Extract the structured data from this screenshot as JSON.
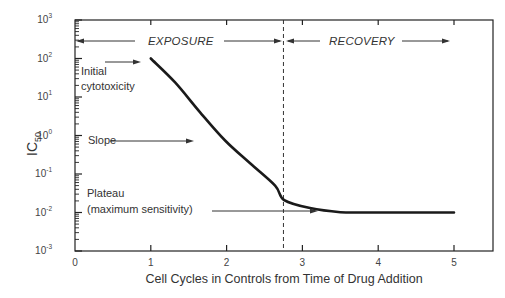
{
  "chart_data": {
    "type": "line",
    "title": "",
    "xlabel": "Cell Cycles in Controls from Time of Drug Addition",
    "ylabel": "IC50",
    "ylabel_main": "IC",
    "ylabel_sub": "50",
    "xlim": [
      0,
      5.5
    ],
    "ylim": [
      0.001,
      1000
    ],
    "yscale": "log",
    "grid": false,
    "legend": null,
    "x_ticks": [
      "0",
      "1",
      "2",
      "3",
      "4",
      "5"
    ],
    "y_ticks": [
      {
        "base": "10",
        "exp": "3"
      },
      {
        "base": "10",
        "exp": "2"
      },
      {
        "base": "10",
        "exp": "1"
      },
      {
        "base": "10",
        "exp": "0"
      },
      {
        "base": "10",
        "exp": "-1"
      },
      {
        "base": "10",
        "exp": "-2"
      },
      {
        "base": "10",
        "exp": "-3"
      }
    ],
    "series": [
      {
        "name": "IC50 curve",
        "x": [
          1.0,
          1.32,
          1.65,
          1.98,
          2.31,
          2.64,
          2.76,
          3.1,
          3.5,
          3.9,
          5.0
        ],
        "y": [
          100,
          24,
          4,
          0.74,
          0.19,
          0.05,
          0.021,
          0.013,
          0.0102,
          0.01,
          0.01
        ]
      }
    ],
    "vertical_marker": {
      "x": 2.75,
      "style": "dashed"
    },
    "phases": [
      {
        "label": "EXPOSURE",
        "x_start": 0,
        "x_end": 2.75
      },
      {
        "label": "RECOVERY",
        "x_start": 2.75,
        "x_end": 5.0
      }
    ],
    "annotations": [
      {
        "lines": [
          "Initial",
          "cytotoxicity"
        ],
        "points_to": "curve start at x=1"
      },
      {
        "lines": [
          "Slope"
        ],
        "points_to": "descending portion of curve"
      },
      {
        "lines": [
          "Plateau",
          "(maximum sensitivity)"
        ],
        "points_to": "plateau at 10^-2"
      }
    ]
  }
}
